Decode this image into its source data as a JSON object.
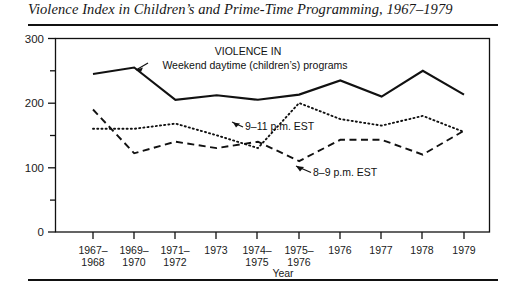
{
  "figure": {
    "title": "Violence Index in Children’s and Prime-Time Programming, 1967–1979",
    "ink_color": "#111111",
    "background": "#ffffff"
  },
  "chart_data": {
    "type": "line",
    "title": "Violence Index in Children’s and Prime-Time Programming, 1967–1979",
    "xlabel": "Year",
    "ylabel": "",
    "ylim": [
      0,
      300
    ],
    "yticks": [
      0,
      50,
      100,
      150,
      200,
      250,
      300
    ],
    "ytick_labels": [
      "0",
      "",
      "100",
      "",
      "200",
      "",
      "300"
    ],
    "ytick_labels_major": [
      "0",
      "100",
      "200",
      "300"
    ],
    "grid": false,
    "legend": "annotations-inline",
    "categories": [
      "1967–1968",
      "1969–1970",
      "1971–1972",
      "1973",
      "1974–1975",
      "1975–1976",
      "1976",
      "1977",
      "1978",
      "1979"
    ],
    "category_lines": [
      [
        "1967–",
        "1968"
      ],
      [
        "1969–",
        "1970"
      ],
      [
        "1971–",
        "1972"
      ],
      [
        "1973",
        ""
      ],
      [
        "1974–",
        "1975"
      ],
      [
        "1975–",
        "1976"
      ],
      [
        "1976",
        ""
      ],
      [
        "1977",
        ""
      ],
      [
        "1978",
        ""
      ],
      [
        "1979",
        ""
      ]
    ],
    "series": [
      {
        "name": "Weekend daytime (children’s) programs",
        "style": "solid",
        "values": [
          245,
          255,
          205,
          212,
          205,
          213,
          235,
          210,
          250,
          213
        ]
      },
      {
        "name": "9–11 p.m. EST",
        "style": "dotted",
        "values": [
          160,
          160,
          168,
          150,
          130,
          200,
          175,
          165,
          180,
          155
        ]
      },
      {
        "name": "8–9 p.m. EST",
        "style": "dashed",
        "values": [
          190,
          122,
          140,
          130,
          140,
          110,
          143,
          143,
          120,
          157
        ]
      }
    ],
    "annotations": [
      {
        "id": "violence-in-label",
        "text": "VIOLENCE IN",
        "x_px": 248,
        "y_px": 51
      },
      {
        "id": "weekend-daytime-label",
        "text": "Weekend daytime (children’s) programs",
        "x_px": 255,
        "y_px": 66
      },
      {
        "id": "prime-late-label",
        "text": "9–11 p.m. EST",
        "x_px": 245,
        "y_px": 127
      },
      {
        "id": "prime-early-label",
        "text": "8–9 p.m. EST",
        "x_px": 313,
        "y_px": 173
      }
    ]
  },
  "axes": {
    "y_labels": [
      "300",
      "200",
      "100",
      "0"
    ],
    "x_axis_name": "Year"
  }
}
